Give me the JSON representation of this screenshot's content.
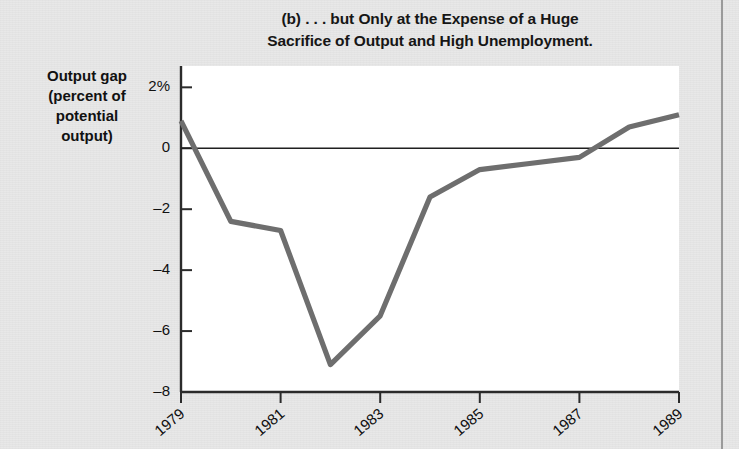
{
  "figure": {
    "title_line1": "(b) . . . but Only at the Expense of a Huge",
    "title_line2": "Sacrifice of Output and High Unemployment.",
    "y_axis_label_line1": "Output gap",
    "y_axis_label_line2": "(percent of",
    "y_axis_label_line3": "potential",
    "y_axis_label_line4": "output)"
  },
  "chart_data": {
    "type": "line",
    "title": "(b) . . . but Only at the Expense of a Huge Sacrifice of Output and High Unemployment.",
    "xlabel": "",
    "ylabel": "Output gap (percent of potential output)",
    "x": [
      1979,
      1980,
      1981,
      1982,
      1983,
      1984,
      1985,
      1986,
      1987,
      1988,
      1989
    ],
    "values": [
      0.9,
      -2.4,
      -2.7,
      -7.1,
      -5.5,
      -1.6,
      -0.7,
      -0.5,
      -0.3,
      0.7,
      1.1
    ],
    "xlim": [
      1979,
      1989
    ],
    "ylim": [
      -8,
      2.7
    ],
    "ytick_labels": [
      "2%",
      "0",
      "-2",
      "-4",
      "-6",
      "-8"
    ],
    "ytick_values": [
      2,
      0,
      -2,
      -4,
      -6,
      -8
    ],
    "xtick_labels": [
      "1979",
      "1981",
      "1983",
      "1985",
      "1987",
      "1989"
    ],
    "xtick_values": [
      1979,
      1981,
      1983,
      1985,
      1987,
      1989
    ],
    "grid": false,
    "legend": "none",
    "zero_line": true,
    "series": [
      {
        "name": "Output gap",
        "color": "#6e6e6e",
        "values": [
          0.9,
          -2.4,
          -2.7,
          -7.1,
          -5.5,
          -1.6,
          -0.7,
          -0.5,
          -0.3,
          0.7,
          1.1
        ]
      }
    ],
    "colors": {
      "line": "#6e6e6e",
      "axis": "#2b2b2b",
      "plot_background": "#ffffff",
      "page_background": "#e8e8e8",
      "text": "#111111"
    }
  }
}
